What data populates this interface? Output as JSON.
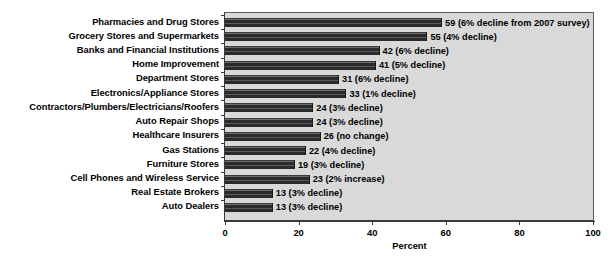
{
  "chart_data": {
    "type": "bar",
    "orientation": "horizontal",
    "title": "",
    "xlabel": "Percent",
    "ylabel": "",
    "xlim": [
      0,
      100
    ],
    "xticks": [
      0,
      20,
      40,
      60,
      80,
      100
    ],
    "grid": false,
    "legend": null,
    "categories": [
      "Pharmacies and Drug Stores",
      "Grocery Stores and Supermarkets",
      "Banks and Financial Institutions",
      "Home Improvement",
      "Department Stores",
      "Electronics/Appliance Stores",
      "Contractors/Plumbers/Electricians/Roofers",
      "Auto Repair Shops",
      "Healthcare Insurers",
      "Gas Stations",
      "Furniture Stores",
      "Cell Phones and Wireless Service",
      "Real Estate Brokers",
      "Auto Dealers"
    ],
    "values": [
      59,
      55,
      42,
      41,
      31,
      33,
      24,
      24,
      26,
      22,
      19,
      23,
      13,
      13
    ],
    "annotations": [
      "59 (6% decline from 2007 survey)",
      "55 (4% decline)",
      "42 (6% decline)",
      "41 (5% decline)",
      "31 (6% decline)",
      "33 (1% decline)",
      "24 (3% decline)",
      "24 (3% decline)",
      "26 (no change)",
      "22 (4% decline)",
      "19 (3% decline)",
      "23 (2% increase)",
      "13 (3% decline)",
      "13 (3% decline)"
    ],
    "colors": {
      "bar": "#2f2f2f",
      "plot_background": "#d9d9d9",
      "axis": "#3a3a3a",
      "text": "#000000",
      "page_background": "#ffffff"
    }
  }
}
